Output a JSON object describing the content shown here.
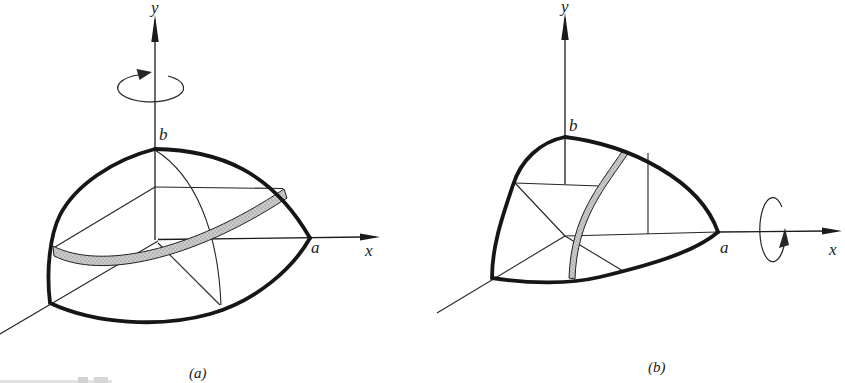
{
  "figure_a": {
    "caption": "(a)",
    "labels": {
      "y_axis": "y",
      "x_axis": "x",
      "semi_axis_horizontal": "a",
      "semi_axis_vertical": "b"
    }
  },
  "figure_b": {
    "caption": "(b)",
    "labels": {
      "y_axis": "y",
      "x_axis": "x",
      "semi_axis_horizontal": "a",
      "semi_axis_vertical": "b"
    }
  },
  "colors": {
    "outline": "#161616",
    "thin_line": "#262626",
    "band_fill": "#cbcbcb",
    "band_dots": "#909090",
    "background": "#ffffff"
  }
}
